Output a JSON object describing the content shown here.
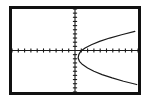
{
  "device": {
    "name": "graphing-calculator-screen",
    "frame_color": "#111111",
    "screen_background": "#ffffff",
    "ink_color": "#1a1a1a"
  },
  "chart_data": {
    "type": "line",
    "title": "",
    "subtitle": "",
    "xlabel": "",
    "ylabel": "",
    "legend": [],
    "annotations": [],
    "grid": false,
    "axes_visible": true,
    "tick_marks": true,
    "xlim": [
      -10,
      10
    ],
    "ylim": [
      -10,
      10
    ],
    "x_tick_step": 1,
    "y_tick_step": 1,
    "x_tick_values": [
      -10,
      -9,
      -8,
      -7,
      -6,
      -5,
      -4,
      -3,
      -2,
      -1,
      1,
      2,
      3,
      4,
      5,
      6,
      7,
      8,
      9,
      10
    ],
    "y_tick_values": [
      -10,
      -9,
      -8,
      -7,
      -6,
      -5,
      -4,
      -3,
      -2,
      -1,
      1,
      2,
      3,
      4,
      5,
      6,
      7,
      8,
      9,
      10
    ],
    "curve_description": "sideways parabola opening to the right, vertex below and right of origin",
    "equation": "x = y^2 + 2y + 1",
    "vertex": [
      0.5,
      -1.8
    ],
    "series": [
      {
        "name": "x = y^2 + 2y + 1",
        "orientation": "horizontal-parabola",
        "x": [
          9.5,
          7.4,
          5.5,
          3.9,
          2.6,
          1.6,
          0.9,
          0.6,
          0.5,
          0.7,
          1.2,
          2.0,
          3.0,
          4.3,
          5.9,
          7.7,
          9.8
        ],
        "y": [
          4.6,
          3.8,
          3.0,
          2.2,
          1.4,
          0.6,
          -0.2,
          -1.0,
          -1.8,
          -2.6,
          -3.4,
          -4.2,
          -5.0,
          -5.8,
          -6.6,
          -7.4,
          -8.2
        ]
      }
    ]
  }
}
